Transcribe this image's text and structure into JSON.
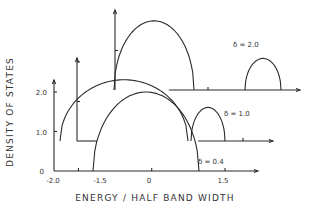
{
  "chart_data": {
    "type": "line",
    "title": "",
    "xlabel": "ENERGY / HALF BAND WIDTH",
    "ylabel": "DENSITY OF STATES",
    "xlim": [
      -2.0,
      2.2
    ],
    "ylim": [
      0,
      2.5
    ],
    "x_ticks": [
      -2.0,
      -1.5,
      0,
      1.5
    ],
    "x_tick_labels": [
      "-2.0",
      "-1.5",
      "0",
      "1.5"
    ],
    "y_ticks": [
      0,
      1.0,
      2.0
    ],
    "y_tick_labels": [
      "0",
      "1.0",
      "2.0"
    ],
    "grid": false,
    "legend": "none",
    "layout": "stacked pseudo-3D offset axes, one per delta",
    "series": [
      {
        "name": "δ = 0.4",
        "annotation": "δ = 0.4",
        "bands": [
          {
            "center": 0.0,
            "half_width": 1.4,
            "peak": 2.0
          }
        ]
      },
      {
        "name": "δ = 1.0",
        "annotation": "δ = 1.0",
        "bands": [
          {
            "center": -0.2,
            "half_width": 1.15,
            "peak": 1.55
          },
          {
            "center": 1.45,
            "half_width": 0.45,
            "peak": 0.85
          }
        ]
      },
      {
        "name": "δ = 2.0",
        "annotation": "δ = 2.0",
        "bands": [
          {
            "center": -0.7,
            "half_width": 1.05,
            "peak": 1.75
          },
          {
            "center": 1.85,
            "half_width": 0.45,
            "peak": 0.8
          }
        ]
      }
    ]
  }
}
